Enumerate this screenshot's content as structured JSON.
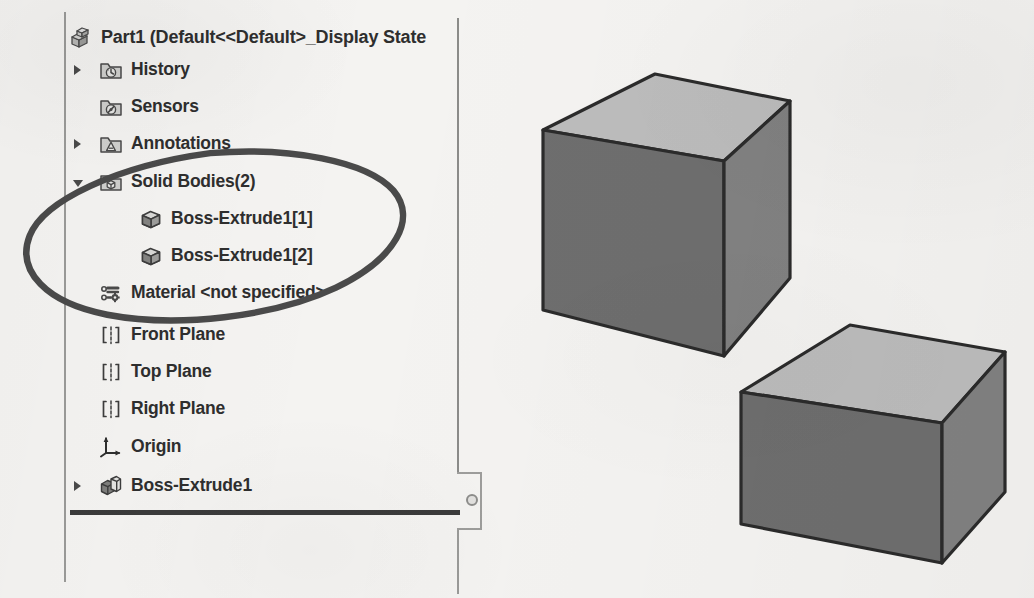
{
  "app": {
    "name": "SolidWorks Feature Manager Design Tree",
    "panel_title": "Part1  (Default<<Default>_Display State"
  },
  "tree": {
    "root": {
      "label": "Part1  (Default<<Default>_Display State",
      "icon": "part-icon"
    },
    "items": [
      {
        "label": "History",
        "icon": "history-folder-icon",
        "indent": 0,
        "expander": "collapsed"
      },
      {
        "label": "Sensors",
        "icon": "sensors-folder-icon",
        "indent": 0,
        "expander": "none"
      },
      {
        "label": "Annotations",
        "icon": "annotations-folder-icon",
        "indent": 0,
        "expander": "collapsed"
      },
      {
        "label": "Solid Bodies(2)",
        "icon": "solid-bodies-folder-icon",
        "indent": 0,
        "expander": "expanded"
      },
      {
        "label": "Boss-Extrude1[1]",
        "icon": "solid-body-icon",
        "indent": 1,
        "expander": "none"
      },
      {
        "label": "Boss-Extrude1[2]",
        "icon": "solid-body-icon",
        "indent": 1,
        "expander": "none"
      },
      {
        "label": "Material <not specified>",
        "icon": "material-icon",
        "indent": 0,
        "expander": "none"
      },
      {
        "label": "Front Plane",
        "icon": "plane-icon",
        "indent": 0,
        "expander": "none"
      },
      {
        "label": "Top Plane",
        "icon": "plane-icon",
        "indent": 0,
        "expander": "none"
      },
      {
        "label": "Right Plane",
        "icon": "plane-icon",
        "indent": 0,
        "expander": "none"
      },
      {
        "label": "Origin",
        "icon": "origin-icon",
        "indent": 0,
        "expander": "none"
      },
      {
        "label": "Boss-Extrude1",
        "icon": "extrude-feature-icon",
        "indent": 0,
        "expander": "collapsed"
      }
    ]
  },
  "annotation": {
    "shape": "hand-drawn-ellipse",
    "encircles": [
      "Solid Bodies(2)",
      "Boss-Extrude1[1]",
      "Boss-Extrude1[2]"
    ],
    "color": "#4a4a4a"
  },
  "viewport": {
    "bodies": [
      {
        "name": "Boss-Extrude1[1]",
        "shape": "box"
      },
      {
        "name": "Boss-Extrude1[2]",
        "shape": "box"
      }
    ],
    "colors": {
      "top_face": "#b9b9b9",
      "front_face": "#6b6b6b",
      "side_face": "#7e7e7e",
      "edge": "#2b2b2b"
    }
  },
  "splitter": {
    "label": "panel-splitter-handle"
  },
  "rollback": {
    "label": "rollback-bar"
  }
}
